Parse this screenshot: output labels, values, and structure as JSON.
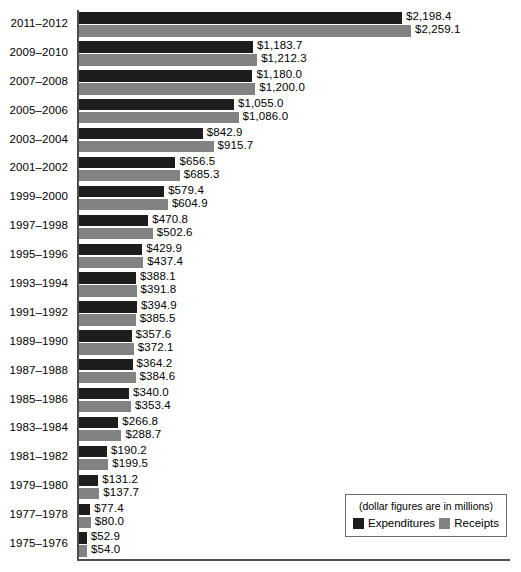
{
  "chart_data": {
    "type": "bar",
    "orientation": "horizontal",
    "title": "",
    "subtitle": "",
    "xlabel": "",
    "ylabel": "",
    "note": "(dollar figures are in millions)",
    "grid": false,
    "legend_position": "bottom-right",
    "value_prefix": "$",
    "xlim": [
      0,
      2450
    ],
    "categories": [
      "2011–2012",
      "2009–2010",
      "2007–2008",
      "2005–2006",
      "2003–2004",
      "2001–2002",
      "1999–2000",
      "1997–1998",
      "1995–1996",
      "1993–1994",
      "1991–1992",
      "1989–1990",
      "1987–1988",
      "1985–1986",
      "1983–1984",
      "1981–1982",
      "1979–1980",
      "1977–1978",
      "1975–1976"
    ],
    "series": [
      {
        "name": "Expenditures",
        "color": "#1d1d1d",
        "values": [
          2198.4,
          1183.7,
          1180.0,
          1055.0,
          842.9,
          656.5,
          579.4,
          470.8,
          429.9,
          388.1,
          394.9,
          357.6,
          364.2,
          340.0,
          266.8,
          190.2,
          131.2,
          77.4,
          52.9
        ],
        "labels": [
          "$2,198.4",
          "$1,183.7",
          "$1,180.0",
          "$1,055.0",
          "$842.9",
          "$656.5",
          "$579.4",
          "$470.8",
          "$429.9",
          "$388.1",
          "$394.9",
          "$357.6",
          "$364.2",
          "$340.0",
          "$266.8",
          "$190.2",
          "$131.2",
          "$77.4",
          "$52.9"
        ]
      },
      {
        "name": "Receipts",
        "color": "#828282",
        "values": [
          2259.1,
          1212.3,
          1200.0,
          1086.0,
          915.7,
          685.3,
          604.9,
          502.6,
          437.4,
          391.8,
          385.5,
          372.1,
          384.6,
          353.4,
          288.7,
          199.5,
          137.7,
          80.0,
          54.0
        ],
        "labels": [
          "$2,259.1",
          "$1,212.3",
          "$1,200.0",
          "$1,086.0",
          "$915.7",
          "$685.3",
          "$604.9",
          "$502.6",
          "$437.4",
          "$391.8",
          "$385.5",
          "$372.1",
          "$384.6",
          "$353.4",
          "$288.7",
          "$199.5",
          "$137.7",
          "$80.0",
          "$54.0"
        ]
      }
    ]
  },
  "legend": {
    "note": "(dollar figures are in millions)",
    "entries": [
      {
        "label": "Expenditures",
        "color": "#1d1d1d"
      },
      {
        "label": "Receipts",
        "color": "#828282"
      }
    ]
  },
  "colors": {
    "expenditures": "#1d1d1d",
    "receipts": "#828282",
    "axis": "#4d4d4d",
    "legend_border": "#6b6b6b",
    "background": "#ffffff"
  }
}
